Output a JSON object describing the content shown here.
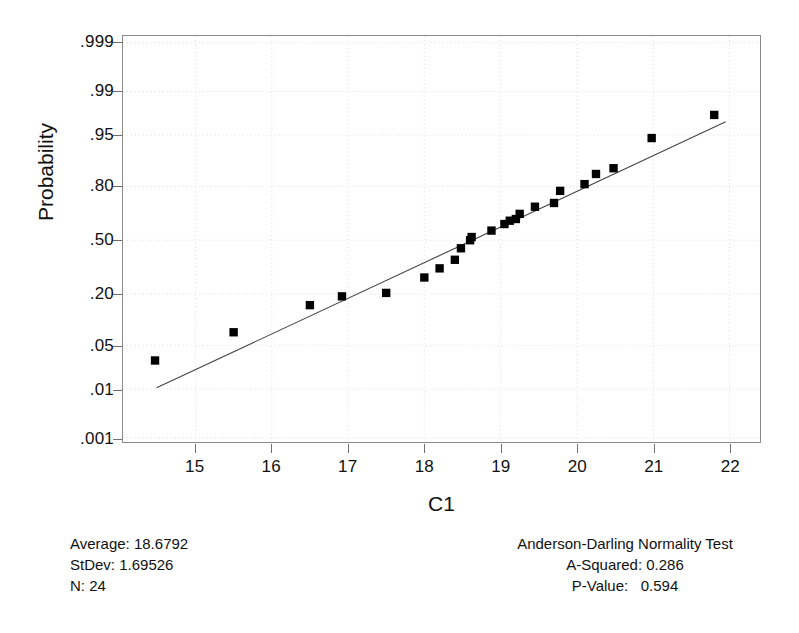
{
  "chart_data": {
    "type": "scatter",
    "title": "",
    "subtitle": "",
    "xlabel": "C1",
    "ylabel": "Probability",
    "xlim": [
      14.05,
      22.4
    ],
    "ylim_probability": [
      0.0008,
      0.9993
    ],
    "grid": true,
    "legend": "none",
    "xticks": [
      "15",
      "16",
      "17",
      "18",
      "19",
      "20",
      "21",
      "22"
    ],
    "xtick_values": [
      15,
      16,
      17,
      18,
      19,
      20,
      21,
      22
    ],
    "yticks": [
      ".999",
      ".99",
      ".95",
      ".80",
      ".50",
      ".20",
      ".05",
      ".01",
      ".001"
    ],
    "ytick_values": [
      0.999,
      0.99,
      0.95,
      0.8,
      0.5,
      0.2,
      0.05,
      0.01,
      0.001
    ],
    "marker": "filled-square",
    "marker_color": "#000000",
    "line_color": "#444444",
    "series": [
      {
        "name": "Normal probability plot points",
        "x": [
          14.47,
          15.5,
          16.5,
          16.92,
          17.5,
          18.0,
          18.2,
          18.4,
          18.48,
          18.6,
          18.62,
          18.88,
          19.05,
          19.12,
          19.2,
          19.25,
          19.45,
          19.7,
          19.78,
          20.1,
          20.25,
          20.48,
          20.98,
          21.8
        ],
        "y": [
          0.03,
          0.075,
          0.155,
          0.19,
          0.205,
          0.28,
          0.33,
          0.38,
          0.45,
          0.5,
          0.52,
          0.56,
          0.6,
          0.62,
          0.63,
          0.66,
          0.7,
          0.72,
          0.78,
          0.81,
          0.85,
          0.87,
          0.945,
          0.975
        ]
      }
    ],
    "fit_line": {
      "name": "Normal fit reference line",
      "x_start": 14.49,
      "y_start": 0.0105,
      "x_end": 21.95,
      "y_end": 0.968
    }
  },
  "stats_left": {
    "average": "Average: 18.6792",
    "stdev": "StDev: 1.69526",
    "n": "N: 24"
  },
  "stats_right": {
    "test_title": "Anderson-Darling Normality Test",
    "a_squared": "A-Squared: 0.286",
    "p_value": "P-Value:   0.594"
  }
}
